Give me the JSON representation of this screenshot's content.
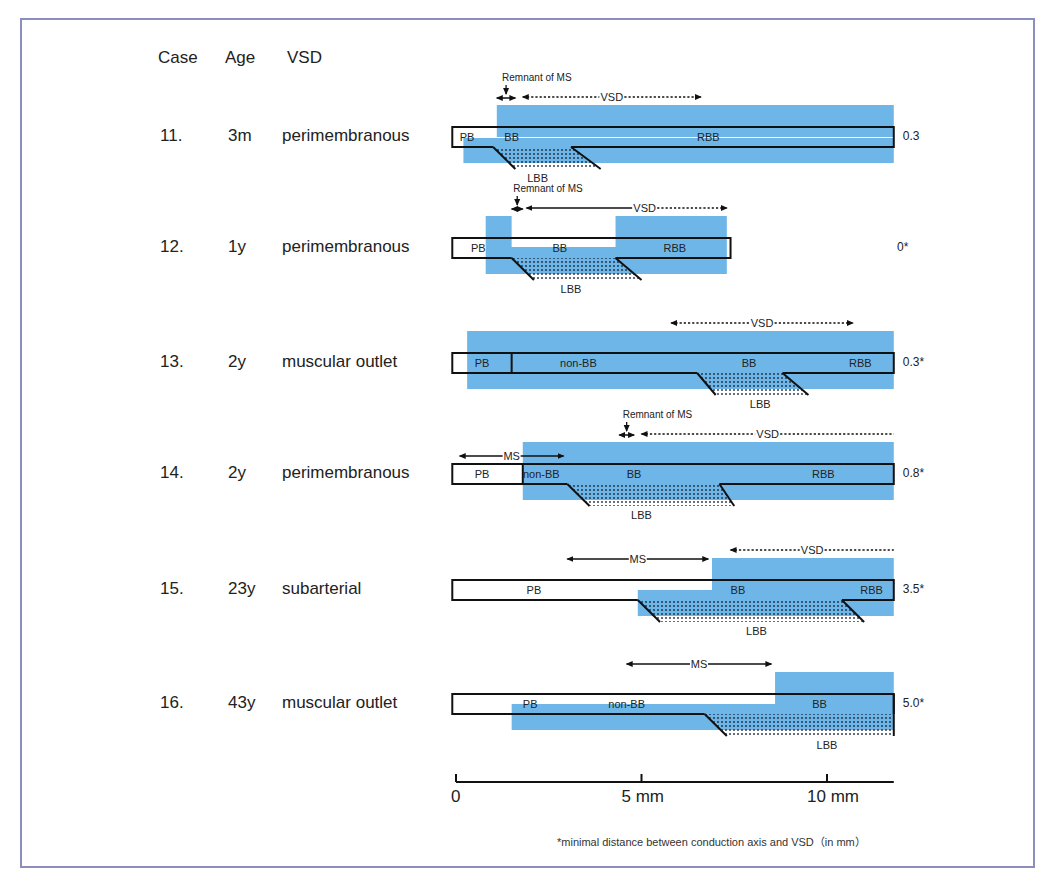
{
  "headers": {
    "case": "Case",
    "age": "Age",
    "vsd": "VSD"
  },
  "colors": {
    "myocardium_blue": "#6fb6e8",
    "frame": "#8a8fbf",
    "line": "#111111"
  },
  "scale": {
    "ticks": [
      {
        "mm": 0,
        "label": "0"
      },
      {
        "mm": 5,
        "label": "5 mm"
      },
      {
        "mm": 10,
        "label": "10 mm"
      }
    ],
    "range_mm": [
      0,
      11.8
    ]
  },
  "footnote": "*minimal distance between conduction axis and VSD（in mm）",
  "cases": [
    {
      "case": "11.",
      "age": "3m",
      "vsd": "perimembranous",
      "distance": "0.3",
      "bar": [
        -0.1,
        11.8
      ],
      "blue": [
        {
          "x": [
            1.1,
            11.8
          ],
          "part": "upper"
        },
        {
          "x": [
            0.2,
            11.8
          ],
          "part": "lower"
        }
      ],
      "dividers": [],
      "white_notch": null,
      "lbb": {
        "top": [
          1.0,
          3.1
        ],
        "bottom": [
          1.6,
          3.9
        ],
        "open_right": false
      },
      "labels": [
        {
          "t": "PB",
          "mm": 0.3
        },
        {
          "t": "BB",
          "mm": 1.5
        },
        {
          "t": "RBB",
          "mm": 6.8
        }
      ],
      "lbb_label_mm": 2.2,
      "annotations": [
        {
          "type": "remnant",
          "text": "Remnant of MS",
          "mm": [
            1.1,
            1.6
          ]
        },
        {
          "type": "dotted",
          "text": "VSD",
          "mm": [
            1.8,
            6.6
          ],
          "left_arrow": true,
          "right_arrow": true
        }
      ]
    },
    {
      "case": "12.",
      "age": "1y",
      "vsd": "perimembranous",
      "distance": "0*",
      "bar": [
        -0.1,
        7.4
      ],
      "blue": [
        {
          "x": [
            0.8,
            7.3
          ],
          "part": "full"
        }
      ],
      "dividers": [],
      "white_notch": [
        1.5,
        4.3
      ],
      "lbb": {
        "top": [
          1.5,
          4.3
        ],
        "bottom": [
          2.1,
          5.0
        ],
        "open_right": false
      },
      "labels": [
        {
          "t": "PB",
          "mm": 0.6
        },
        {
          "t": "BB",
          "mm": 2.8
        },
        {
          "t": "RBB",
          "mm": 5.9
        }
      ],
      "lbb_label_mm": 3.1,
      "annotations": [
        {
          "type": "remnant",
          "text": "Remnant of MS",
          "mm": [
            1.5,
            1.8
          ]
        },
        {
          "type": "solid-dotted",
          "text": "VSD",
          "mm": [
            1.9,
            7.3
          ],
          "split_mm": 4.6,
          "left_arrow": true,
          "right_arrow": true
        }
      ]
    },
    {
      "case": "13.",
      "age": "2y",
      "vsd": "muscular outlet",
      "distance": "0.3*",
      "bar": [
        -0.1,
        11.8
      ],
      "blue": [
        {
          "x": [
            0.3,
            11.8
          ],
          "part": "full"
        }
      ],
      "dividers": [
        1.5
      ],
      "white_notch": null,
      "lbb": {
        "top": [
          6.5,
          8.8
        ],
        "bottom": [
          7.0,
          9.5
        ],
        "open_right": false
      },
      "labels": [
        {
          "t": "PB",
          "mm": 0.7
        },
        {
          "t": "non-BB",
          "mm": 3.3
        },
        {
          "t": "BB",
          "mm": 7.9
        },
        {
          "t": "RBB",
          "mm": 10.9
        }
      ],
      "lbb_label_mm": 8.2,
      "annotations": [
        {
          "type": "dotted",
          "text": "VSD",
          "mm": [
            5.8,
            10.7
          ],
          "left_arrow": true,
          "right_arrow": true
        }
      ]
    },
    {
      "case": "14.",
      "age": "2y",
      "vsd": "perimembranous",
      "distance": "0.8*",
      "bar": [
        -0.1,
        11.8
      ],
      "blue": [
        {
          "x": [
            1.8,
            11.8
          ],
          "part": "full"
        }
      ],
      "dividers": [
        1.8
      ],
      "white_notch": null,
      "lbb": {
        "top": [
          3.0,
          7.1
        ],
        "bottom": [
          3.6,
          7.5
        ],
        "open_right": false
      },
      "labels": [
        {
          "t": "PB",
          "mm": 0.7
        },
        {
          "t": "non-BB",
          "mm": 2.3
        },
        {
          "t": "BB",
          "mm": 4.8
        },
        {
          "t": "RBB",
          "mm": 9.9
        }
      ],
      "lbb_label_mm": 5.0,
      "annotations": [
        {
          "type": "remnant",
          "text": "Remnant of MS",
          "mm": [
            4.4,
            4.8
          ]
        },
        {
          "type": "dotted",
          "text": "VSD",
          "mm": [
            5.0,
            11.8
          ],
          "left_arrow": true,
          "right_arrow": false
        },
        {
          "type": "solid",
          "text": "MS",
          "mm": [
            0.1,
            2.9
          ],
          "left_arrow": true,
          "right_arrow": true
        }
      ]
    },
    {
      "case": "15.",
      "age": "23y",
      "vsd": "subarterial",
      "distance": "3.5*",
      "bar": [
        -0.1,
        11.8
      ],
      "blue": [
        {
          "x": [
            6.9,
            11.8
          ],
          "part": "upper"
        },
        {
          "x": [
            4.9,
            11.8
          ],
          "part": "lower"
        }
      ],
      "dividers": [],
      "white_notch": null,
      "lbb": {
        "top": [
          4.9,
          10.4
        ],
        "bottom": [
          5.5,
          11.0
        ],
        "open_right": false
      },
      "labels": [
        {
          "t": "PB",
          "mm": 2.1
        },
        {
          "t": "BB",
          "mm": 7.6
        },
        {
          "t": "RBB",
          "mm": 11.2
        }
      ],
      "lbb_label_mm": 8.1,
      "annotations": [
        {
          "type": "dotted",
          "text": "VSD",
          "mm": [
            7.4,
            11.8
          ],
          "left_arrow": true,
          "right_arrow": false
        },
        {
          "type": "solid",
          "text": "MS",
          "mm": [
            3.0,
            6.8
          ],
          "left_arrow": true,
          "right_arrow": true
        }
      ]
    },
    {
      "case": "16.",
      "age": "43y",
      "vsd": "muscular outlet",
      "distance": "5.0*",
      "bar": [
        -0.1,
        11.8
      ],
      "blue": [
        {
          "x": [
            8.6,
            11.8
          ],
          "part": "upper"
        },
        {
          "x": [
            1.5,
            11.8
          ],
          "part": "lower"
        }
      ],
      "dividers": [],
      "white_notch": null,
      "lbb": {
        "top": [
          6.7,
          11.8
        ],
        "bottom": [
          7.3,
          11.8
        ],
        "open_right": true
      },
      "labels": [
        {
          "t": "PB",
          "mm": 2.0
        },
        {
          "t": "non-BB",
          "mm": 4.6
        },
        {
          "t": "BB",
          "mm": 9.8
        }
      ],
      "lbb_label_mm": 10.0,
      "annotations": [
        {
          "type": "solid",
          "text": "MS",
          "mm": [
            4.6,
            8.5
          ],
          "left_arrow": true,
          "right_arrow": true
        }
      ]
    }
  ]
}
